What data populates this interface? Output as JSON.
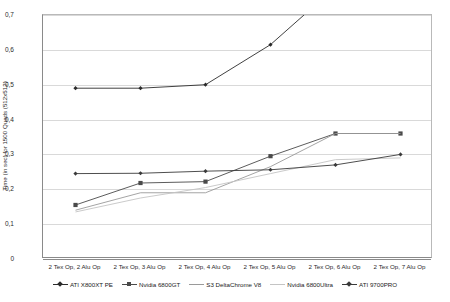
{
  "chart_data": {
    "type": "line",
    "title": "",
    "xlabel": "",
    "ylabel": "Time (in sec) for 1500 Quads (512x512)",
    "ylim": [
      0,
      0.7
    ],
    "yticks": [
      0,
      0.1,
      0.2,
      0.3,
      0.4,
      0.5,
      0.6,
      0.7
    ],
    "ytick_labels": [
      "0",
      "0,1",
      "0,2",
      "0,3",
      "0,4",
      "0,5",
      "0,6",
      "0,7"
    ],
    "grid": true,
    "legend_position": "bottom",
    "categories": [
      "2 Tex Op, 2 Alu Op",
      "2 Tex Op, 3 Alu Op",
      "2 Tex Op, 4 Alu Op",
      "2 Tex Op, 5 Alu Op",
      "2 Tex Op, 6 Alu Op",
      "2 Tex Op, 7 Alu Op"
    ],
    "series": [
      {
        "name": "ATI X800XT PE",
        "color": "#2b2b2b",
        "marker": "diamond",
        "values": [
          0.49,
          0.49,
          0.5,
          0.615,
          0.78,
          0.95
        ],
        "clipped_above_axis": true
      },
      {
        "name": "Nvidia 6800GT",
        "color": "#4a4a4a",
        "marker": "square",
        "values": [
          0.155,
          0.218,
          0.222,
          0.295,
          0.36,
          0.36
        ]
      },
      {
        "name": "S3 DeltaChrome V8",
        "color": "#9a9a9a",
        "marker": "none",
        "values": [
          0.14,
          0.19,
          0.19,
          0.265,
          0.36,
          0.36
        ]
      },
      {
        "name": "Nvidia 6800Ultra",
        "color": "#c4c4c4",
        "marker": "none",
        "values": [
          0.135,
          0.175,
          0.205,
          0.245,
          0.285,
          0.29
        ]
      },
      {
        "name": "ATI 9700PRO",
        "color": "#3a3a3a",
        "marker": "diamond",
        "values": [
          0.245,
          0.246,
          0.252,
          0.256,
          0.27,
          0.3
        ]
      }
    ]
  }
}
